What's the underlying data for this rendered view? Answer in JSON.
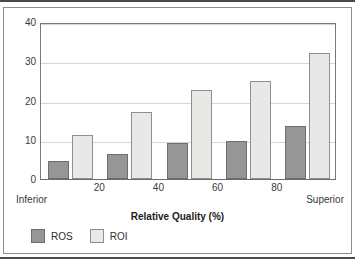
{
  "chart_data": {
    "type": "bar",
    "title": "",
    "xlabel": "Relative Quality (%)",
    "ylabel": "",
    "categories": [
      "10",
      "30",
      "50",
      "70",
      "90"
    ],
    "series": [
      {
        "name": "ROS",
        "values": [
          4.7,
          6.4,
          9.3,
          9.7,
          13.4
        ],
        "color": "#969696"
      },
      {
        "name": "ROI",
        "values": [
          11.3,
          17.0,
          22.7,
          25.0,
          32.0
        ],
        "color": "#e8e8e6"
      }
    ],
    "ylim": [
      0,
      40
    ],
    "yticks": [
      0,
      10,
      20,
      30,
      40
    ],
    "ytick_labels": [
      "0",
      "10",
      "20",
      "30",
      "40"
    ],
    "xlim": [
      0,
      100
    ],
    "xticks": [
      20,
      40,
      60,
      80
    ],
    "xtick_labels": [
      "20",
      "40",
      "60",
      "80"
    ],
    "grid": true,
    "legend_position": "below-left",
    "annotations": {
      "x_left_endpoint": "Inferior",
      "x_right_endpoint": "Superior"
    }
  },
  "legend": {
    "items": [
      {
        "label": "ROS",
        "swatch": "ros"
      },
      {
        "label": "ROI",
        "swatch": "roi"
      }
    ]
  },
  "colors": {
    "ros_fill": "#969696",
    "roi_fill": "#e8e8e6",
    "grid": "#d6d6d6",
    "axis": "#7a7a7a",
    "frame": "#4a4a4a",
    "text": "#3a3a3a"
  }
}
